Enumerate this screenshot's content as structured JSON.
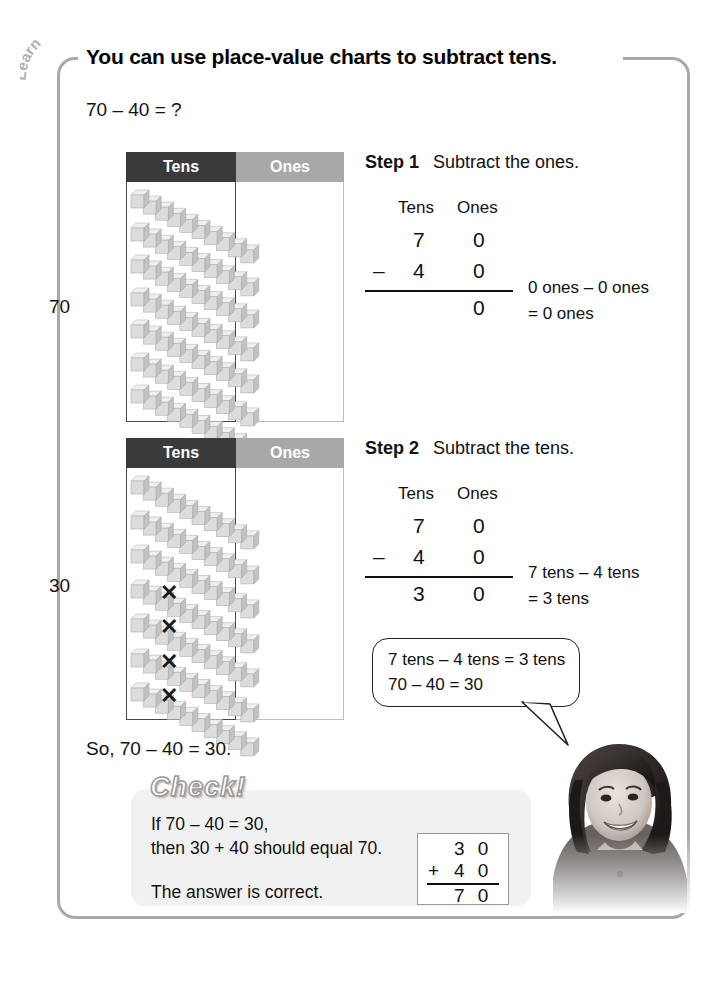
{
  "tab": {
    "label": "Learn"
  },
  "header": {
    "title": "You can use place-value charts to subtract tens."
  },
  "problem": {
    "expression": "70 – 40 = ?"
  },
  "charts": [
    {
      "id": "chart-step1",
      "row_label": "70",
      "columns": {
        "tens": "Tens",
        "ones": "Ones"
      },
      "tens_rods": 7,
      "ones_units": 0,
      "crossed_rods": 0
    },
    {
      "id": "chart-step2",
      "row_label": "30",
      "columns": {
        "tens": "Tens",
        "ones": "Ones"
      },
      "tens_rods": 7,
      "ones_units": 0,
      "crossed_rods": 4
    }
  ],
  "steps": [
    {
      "label": "Step 1",
      "instruction": "Subtract the ones.",
      "col_tens": "Tens",
      "col_ones": "Ones",
      "minuend": {
        "tens": "7",
        "ones": "0"
      },
      "subtrahend": {
        "op": "–",
        "tens": "4",
        "ones": "0"
      },
      "result": {
        "tens": "",
        "ones": "0"
      },
      "note_line1": "0 ones – 0 ones",
      "note_line2": "= 0 ones"
    },
    {
      "label": "Step 2",
      "instruction": "Subtract the tens.",
      "col_tens": "Tens",
      "col_ones": "Ones",
      "minuend": {
        "tens": "7",
        "ones": "0"
      },
      "subtrahend": {
        "op": "–",
        "tens": "4",
        "ones": "0"
      },
      "result": {
        "tens": "3",
        "ones": "0"
      },
      "note_line1": "7 tens – 4 tens",
      "note_line2": "= 3 tens"
    }
  ],
  "bubble": {
    "line1": "7 tens – 4 tens = 3 tens",
    "line2": "70 – 40 = 30"
  },
  "conclusion": {
    "text": "So, 70 – 40 = 30."
  },
  "check": {
    "title": "Check!",
    "line1": "If 70 – 40 = 30,",
    "line2": "then 30 + 40 should equal 70.",
    "line3": "The answer is correct.",
    "addition": {
      "addend1": "3 0",
      "op": "+",
      "addend2": "4 0",
      "sum": "7 0"
    }
  },
  "colors": {
    "tens_header": "#3a3a3a",
    "ones_header": "#a8a8a8",
    "page_border": "#a9a9a9",
    "check_panel": "#f1f1f1",
    "rod": "#d6d6d6"
  }
}
